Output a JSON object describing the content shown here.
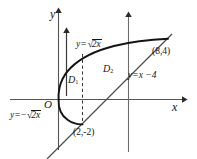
{
  "figure": {
    "name": "coordinate-plane-region-diagram",
    "axes": {
      "x_label": "x",
      "y_label": "y",
      "origin_label": "O"
    },
    "curves": [
      {
        "id": "parabola-upper",
        "label": "y=√2x",
        "equation": "y = √(2x)"
      },
      {
        "id": "parabola-lower",
        "label": "y=−√2x",
        "equation": "y = −√(2x)"
      },
      {
        "id": "line",
        "label": "y=x −4",
        "equation": "y = x − 4"
      }
    ],
    "regions": [
      {
        "id": "D1",
        "label": "D",
        "subscript": "1"
      },
      {
        "id": "D2",
        "label": "D",
        "subscript": "2"
      }
    ],
    "points": [
      {
        "id": "intersection-upper",
        "label": "(8,4)",
        "x": 8,
        "y": 4
      },
      {
        "id": "intersection-lower",
        "label": "(2,-2)",
        "x": 2,
        "y": -2
      }
    ],
    "label_parts": {
      "y_eq": "y=",
      "minus": "−",
      "radicand": "2x",
      "line_eq": "y=x −4"
    }
  }
}
